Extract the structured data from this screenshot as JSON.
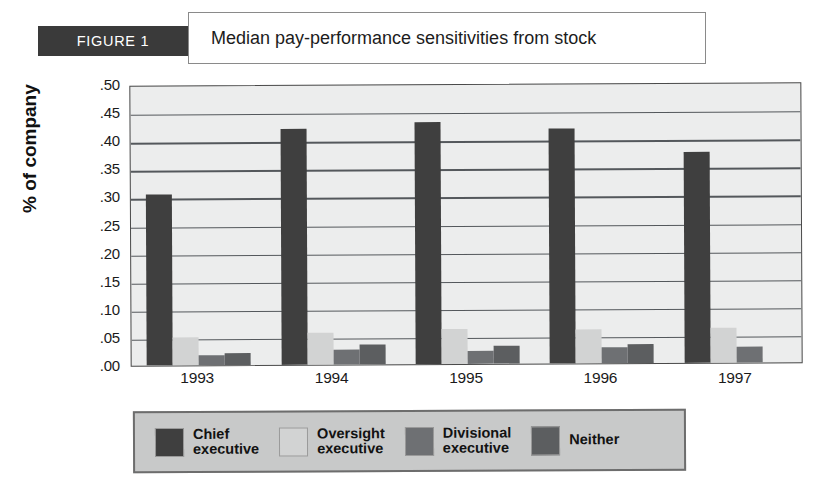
{
  "figure": {
    "tag": "FIGURE 1",
    "title": "Median pay-performance sensitivities from stock"
  },
  "chart_data": {
    "type": "bar",
    "title": "Median pay-performance sensitivities from stock",
    "xlabel": "",
    "ylabel": "% of company",
    "categories": [
      "1993",
      "1994",
      "1995",
      "1996",
      "1997"
    ],
    "ylim": [
      0.0,
      0.5
    ],
    "yticks": [
      ".50",
      ".45",
      ".40",
      ".35",
      ".30",
      ".25",
      ".20",
      ".15",
      ".10",
      ".05",
      ".00"
    ],
    "ytick_values": [
      0.5,
      0.45,
      0.4,
      0.35,
      0.3,
      0.25,
      0.2,
      0.15,
      0.1,
      0.05,
      0.0
    ],
    "grid": true,
    "legend_position": "bottom",
    "series": [
      {
        "name": "Chief executive",
        "label_line1": "Chief",
        "label_line2": "executive",
        "color": "#3f3f3f",
        "values": [
          0.305,
          0.42,
          0.43,
          0.418,
          0.375
        ]
      },
      {
        "name": "Oversight executive",
        "label_line1": "Oversight",
        "label_line2": "executive",
        "color": "#d2d3d3",
        "values": [
          0.05,
          0.057,
          0.063,
          0.06,
          0.062
        ]
      },
      {
        "name": "Divisional executive",
        "label_line1": "Divisional",
        "label_line2": "executive",
        "color": "#6e7073",
        "values": [
          0.018,
          0.027,
          0.024,
          0.028,
          0.029
        ]
      },
      {
        "name": "Neither",
        "label_line1": "Neither",
        "label_line2": "",
        "color": "#5c5e60",
        "values": [
          0.022,
          0.035,
          0.032,
          0.034,
          0.0
        ]
      }
    ]
  }
}
